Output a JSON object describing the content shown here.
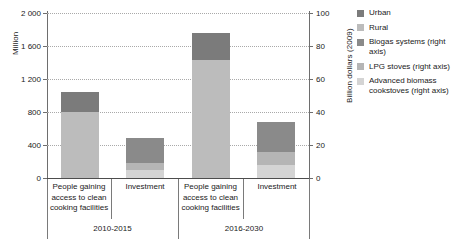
{
  "chart_data": {
    "type": "bar",
    "title": "",
    "subtitle": "",
    "stacked": true,
    "grid": true,
    "legend_position": "right",
    "categories": [
      "People gaining access to clean cooking facilities",
      "Investment",
      "People gaining access to clean cooking facilities",
      "Investment"
    ],
    "groups": [
      {
        "label": "2010-2015",
        "categories": [
          "People gaining access to clean cooking facilities",
          "Investment"
        ]
      },
      {
        "label": "2016-2030",
        "categories": [
          "People gaining access to clean cooking facilities",
          "Investment"
        ]
      }
    ],
    "axes": {
      "left": {
        "label": "Million",
        "min": 0,
        "max": 2000,
        "ticks": [
          0,
          400,
          800,
          1200,
          1600,
          2000
        ],
        "tick_labels": [
          "0",
          "400",
          "800",
          "1 200",
          "1 600",
          "2 000"
        ]
      },
      "right": {
        "label": "Billion dollars (2009)",
        "min": 0,
        "max": 100,
        "ticks": [
          0,
          20,
          40,
          60,
          80,
          100
        ],
        "tick_labels": [
          "0",
          "20",
          "40",
          "60",
          "80",
          "100"
        ]
      }
    },
    "series": [
      {
        "name": "Urban",
        "axis": "left",
        "color": "#7b7b7b",
        "values": [
          248,
          null,
          322,
          null
        ]
      },
      {
        "name": "Rural",
        "axis": "left",
        "color": "#bcbcbc",
        "values": [
          800,
          null,
          1433,
          null
        ]
      },
      {
        "name": "Biogas systems (right axis)",
        "axis": "right",
        "color": "#8a8a8a",
        "values": [
          null,
          15.2,
          null,
          18.2
        ]
      },
      {
        "name": "LPG stoves (right axis)",
        "axis": "right",
        "color": "#b5b5b5",
        "values": [
          null,
          4.2,
          null,
          7.9
        ]
      },
      {
        "name": "Advanced biomass cookstoves (right axis)",
        "axis": "right",
        "color": "#d4d4d4",
        "values": [
          null,
          4.8,
          null,
          7.9
        ]
      }
    ],
    "bars": [
      {
        "group": "2010-2015",
        "category": "People gaining access to clean cooking facilities",
        "axis": "left",
        "total": 1048,
        "segments": [
          {
            "name": "Rural",
            "value": 800,
            "color": "#bcbcbc"
          },
          {
            "name": "Urban",
            "value": 248,
            "color": "#7b7b7b"
          }
        ]
      },
      {
        "group": "2010-2015",
        "category": "Investment",
        "axis": "right",
        "total": 24.2,
        "segments": [
          {
            "name": "Advanced biomass cookstoves (right axis)",
            "value": 4.8,
            "color": "#d4d4d4"
          },
          {
            "name": "LPG stoves (right axis)",
            "value": 4.2,
            "color": "#b5b5b5"
          },
          {
            "name": "Biogas systems (right axis)",
            "value": 15.2,
            "color": "#8a8a8a"
          }
        ]
      },
      {
        "group": "2016-2030",
        "category": "People gaining access to clean cooking facilities",
        "axis": "left",
        "total": 1755,
        "segments": [
          {
            "name": "Rural",
            "value": 1433,
            "color": "#bcbcbc"
          },
          {
            "name": "Urban",
            "value": 322,
            "color": "#7b7b7b"
          }
        ]
      },
      {
        "group": "2016-2030",
        "category": "Investment",
        "axis": "right",
        "total": 34.0,
        "segments": [
          {
            "name": "Advanced biomass cookstoves (right axis)",
            "value": 7.9,
            "color": "#d4d4d4"
          },
          {
            "name": "LPG stoves (right axis)",
            "value": 7.9,
            "color": "#b5b5b5"
          },
          {
            "name": "Biogas systems (right axis)",
            "value": 18.2,
            "color": "#8a8a8a"
          }
        ]
      }
    ]
  },
  "axis": {
    "left_title": "Million",
    "right_title": "Billion dollars (2009)",
    "left_ticks": [
      "2 000",
      "1 600",
      "1 200",
      "800",
      "400",
      "0"
    ],
    "right_ticks": [
      "100",
      "80",
      "60",
      "40",
      "20",
      "0"
    ]
  },
  "categories": {
    "c0": "People gaining access to clean cooking facilities",
    "c1": "Investment",
    "c2": "People gaining access to clean cooking facilities",
    "c3": "Investment",
    "g0": "2010-2015",
    "g1": "2016-2030"
  },
  "legend": {
    "items": [
      {
        "label": "Urban",
        "color": "#7b7b7b"
      },
      {
        "label": "Rural",
        "color": "#bcbcbc"
      },
      {
        "label": "Biogas systems (right axis)",
        "color": "#8a8a8a"
      },
      {
        "label": "LPG stoves (right axis)",
        "color": "#b5b5b5"
      },
      {
        "label": "Advanced biomass cookstoves (right axis)",
        "color": "#d4d4d4"
      }
    ]
  }
}
